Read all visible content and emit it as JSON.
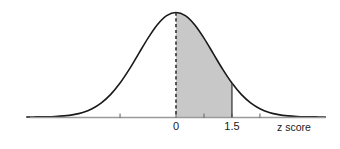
{
  "chart_data": {
    "type": "area",
    "title": "",
    "subtitle": "",
    "xlabel": "z score",
    "ylabel": "",
    "distribution": "standard normal",
    "mean": 0,
    "sd": 1,
    "xlim": [
      -4,
      4
    ],
    "ylim": [
      0,
      0.4
    ],
    "grid": false,
    "legend": null,
    "tick_labels": [
      {
        "value": 0,
        "text": "0"
      },
      {
        "value": 1.5,
        "text": "1.5"
      }
    ],
    "unlabeled_ticks": [
      -1.5,
      0.75,
      2.25
    ],
    "shaded_region": {
      "from": 0,
      "to": 1.5,
      "fill_color": "#c8c8c8",
      "label": ""
    },
    "reference_lines": [
      {
        "value": 0,
        "style": "dashed",
        "color": "#3c3c3c",
        "from_curve_to_axis": true
      },
      {
        "value": 1.5,
        "style": "solid",
        "color": "#3c3c3c",
        "from_curve_to_axis": true
      }
    ],
    "curve_color": "#1a1a1a",
    "axis_color": "#9a9a9a",
    "background_color": "#ffffff",
    "x": [
      -4,
      -3.75,
      -3.5,
      -3.25,
      -3,
      -2.75,
      -2.5,
      -2.25,
      -2,
      -1.75,
      -1.5,
      -1.25,
      -1,
      -0.75,
      -0.5,
      -0.25,
      0,
      0.25,
      0.5,
      0.75,
      1,
      1.25,
      1.5,
      1.75,
      2,
      2.25,
      2.5,
      2.75,
      3,
      3.25,
      3.5,
      3.75,
      4
    ],
    "y": [
      0.0001,
      0.0004,
      0.0009,
      0.002,
      0.0044,
      0.0091,
      0.0175,
      0.0317,
      0.054,
      0.0863,
      0.1295,
      0.1826,
      0.242,
      0.3011,
      0.3521,
      0.3867,
      0.3989,
      0.3867,
      0.3521,
      0.3011,
      0.242,
      0.1826,
      0.1295,
      0.0863,
      0.054,
      0.0317,
      0.0175,
      0.0091,
      0.0044,
      0.002,
      0.0009,
      0.0004,
      0.0001
    ]
  },
  "labels": {
    "tick_zero": "0",
    "tick_one_five": "1.5",
    "axis_title": "z score"
  }
}
